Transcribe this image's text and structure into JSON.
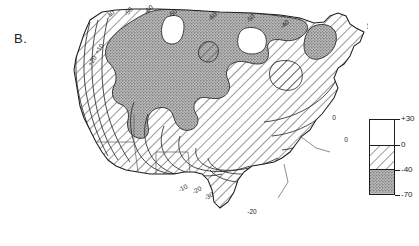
{
  "figure": {
    "panel_label": "B.",
    "type": "contour-map",
    "region": "contiguous-united-states"
  },
  "legend": {
    "name": "fill-category-legend",
    "ticks": [
      {
        "label": "+30",
        "value": 30
      },
      {
        "label": "0",
        "value": 0
      },
      {
        "label": "-40",
        "value": -40
      },
      {
        "label": "-70",
        "value": -70
      }
    ],
    "bands": [
      {
        "name": "white-band",
        "range": "+30 to 0",
        "fill": "white"
      },
      {
        "name": "hatched-band",
        "range": "0 to -40",
        "fill": "diagonal-hatch"
      },
      {
        "name": "stipple-band",
        "range": "-40 to -70",
        "fill": "gray-stipple"
      }
    ]
  },
  "colors": {
    "outline": "#1d1d1d",
    "contour": "#2a2a2a",
    "stipple_gray": "#9e9e9e",
    "hatch_line": "#3a3a3a",
    "background": "#ffffff"
  },
  "chart_data": {
    "type": "heatmap",
    "title": "B.",
    "xlabel": "",
    "ylabel": "",
    "grid": false,
    "legend_position": "right",
    "contour_interval": 10,
    "units": "",
    "levels": [
      30,
      20,
      10,
      0,
      -10,
      -20,
      -30,
      -40,
      -50,
      -60,
      -70
    ],
    "fill_classes": [
      {
        "label": "+30 to 0",
        "pattern": "white"
      },
      {
        "label": "0 to -40",
        "pattern": "hatch"
      },
      {
        "label": "-40 to -70",
        "pattern": "stipple"
      }
    ],
    "contour_labels": [
      {
        "text": "-40",
        "x": 74,
        "y": 14,
        "rotate": -52
      },
      {
        "text": "-50",
        "x": 92,
        "y": 11,
        "rotate": -48
      },
      {
        "text": "-60",
        "x": 112,
        "y": 9,
        "rotate": -40
      },
      {
        "text": "-50",
        "x": 136,
        "y": 13,
        "rotate": -38
      },
      {
        "text": "-60",
        "x": 176,
        "y": 16,
        "rotate": -42
      },
      {
        "text": "-50",
        "x": 214,
        "y": 18,
        "rotate": -46
      },
      {
        "text": "-40",
        "x": 248,
        "y": 24,
        "rotate": -40
      },
      {
        "text": "-40",
        "x": 333,
        "y": 24,
        "rotate": -58
      },
      {
        "text": "-30",
        "x": 344,
        "y": 38,
        "rotate": -58
      },
      {
        "text": "-20",
        "x": 340,
        "y": 62,
        "rotate": -52
      },
      {
        "text": "-30",
        "x": 385,
        "y": 38,
        "rotate": -56
      },
      {
        "text": "+10",
        "x": 63,
        "y": 48,
        "rotate": -56
      },
      {
        "text": "+20",
        "x": 56,
        "y": 60,
        "rotate": -56
      },
      {
        "text": "0",
        "x": 296,
        "y": 118,
        "rotate": 0
      },
      {
        "text": "0",
        "x": 308,
        "y": 140,
        "rotate": 0
      },
      {
        "text": "-10",
        "x": 146,
        "y": 188,
        "rotate": -30
      },
      {
        "text": "-20",
        "x": 160,
        "y": 190,
        "rotate": -30
      },
      {
        "text": "-30",
        "x": 172,
        "y": 196,
        "rotate": -30
      },
      {
        "text": "-20",
        "x": 214,
        "y": 212,
        "rotate": 0
      }
    ]
  }
}
